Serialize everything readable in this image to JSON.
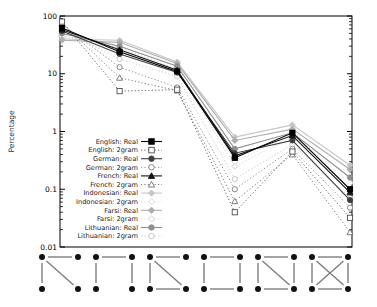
{
  "chart_data": {
    "type": "line",
    "title": "",
    "xlabel": "",
    "ylabel": "Percentage",
    "yscale": "log",
    "ylim": [
      0.01,
      100
    ],
    "ytick_labels": [
      "100",
      "10",
      "1",
      "0.1",
      "0.01"
    ],
    "grid": false,
    "legend_position": "inside-left-lower",
    "categories": [
      "motif-1",
      "motif-2",
      "motif-3",
      "motif-4",
      "motif-5",
      "motif-6"
    ],
    "series": [
      {
        "name": "english-real",
        "label": "English: Real",
        "marker": "square",
        "filled": true,
        "color": "#000000",
        "line": "solid",
        "values": [
          62,
          24,
          11,
          0.35,
          0.95,
          0.1
        ]
      },
      {
        "name": "english-2gram",
        "label": "English: 2gram",
        "marker": "square",
        "filled": false,
        "color": "#4d4d4d",
        "line": "dotted",
        "values": [
          80,
          5,
          5.3,
          0.04,
          0.45,
          0.032
        ]
      },
      {
        "name": "german-real",
        "label": "German: Real",
        "marker": "circle",
        "filled": true,
        "color": "#3f3f3f",
        "line": "solid",
        "values": [
          55,
          22,
          10.5,
          0.42,
          0.7,
          0.065
        ]
      },
      {
        "name": "german-2gram",
        "label": "German: 2gram",
        "marker": "circle",
        "filled": false,
        "color": "#7a7a7a",
        "line": "dotted",
        "values": [
          72,
          13,
          5.8,
          0.1,
          0.5,
          0.048
        ]
      },
      {
        "name": "french-real",
        "label": "French: Real",
        "marker": "triangle",
        "filled": true,
        "color": "#141414",
        "line": "solid",
        "values": [
          58,
          26,
          11.5,
          0.38,
          0.85,
          0.088
        ]
      },
      {
        "name": "french-2gram",
        "label": "French: 2gram",
        "marker": "triangle",
        "filled": false,
        "color": "#6e6e6e",
        "line": "dotted",
        "values": [
          76,
          8.5,
          5.1,
          0.062,
          0.4,
          0.018
        ]
      },
      {
        "name": "indonesian-real",
        "label": "Indonesian: Real",
        "marker": "diamond",
        "filled": true,
        "color": "#c6c6c6",
        "line": "solid",
        "values": [
          40,
          38,
          16,
          0.8,
          1.3,
          0.26
        ]
      },
      {
        "name": "indonesian-2gram",
        "label": "Indonesian: 2gram",
        "marker": "diamond",
        "filled": false,
        "color": "#d8d8d8",
        "line": "dotted",
        "values": [
          46,
          30,
          13,
          0.3,
          0.9,
          0.13
        ]
      },
      {
        "name": "farsi-real",
        "label": "Farsi: Real",
        "marker": "diamond",
        "filled": true,
        "color": "#adadad",
        "line": "solid",
        "values": [
          38,
          35,
          15,
          0.7,
          1.1,
          0.22
        ]
      },
      {
        "name": "farsi-2gram",
        "label": "Farsi: 2gram",
        "marker": "diamond",
        "filled": false,
        "color": "#cccccc",
        "line": "dotted",
        "values": [
          44,
          28,
          12,
          0.25,
          0.8,
          0.1
        ]
      },
      {
        "name": "lithuanian-real",
        "label": "Lithuanian: Real",
        "marker": "circle",
        "filled": true,
        "color": "#8f8f8f",
        "line": "solid",
        "values": [
          50,
          30,
          13.5,
          0.5,
          0.95,
          0.16
        ]
      },
      {
        "name": "lithuanian-2gram",
        "label": "Lithuanian: 2gram",
        "marker": "circle",
        "filled": false,
        "color": "#c2c2c2",
        "line": "dotted",
        "values": [
          58,
          18,
          9,
          0.15,
          0.6,
          0.07
        ]
      }
    ],
    "x_axis_motifs": {
      "description": "six 4-node subgraph diagrams used as x-axis category labels",
      "node_color": "#111111",
      "edge_color": "#7d7d7d",
      "motifs": [
        {
          "name": "motif-1",
          "edges": [
            [
              "TL",
              "TR"
            ],
            [
              "TL",
              "BL"
            ],
            [
              "TL",
              "BR"
            ]
          ]
        },
        {
          "name": "motif-2",
          "edges": [
            [
              "TL",
              "TR"
            ],
            [
              "TL",
              "BL"
            ],
            [
              "TR",
              "BR"
            ]
          ]
        },
        {
          "name": "motif-3",
          "edges": [
            [
              "TL",
              "TR"
            ],
            [
              "TL",
              "BL"
            ],
            [
              "TL",
              "BR"
            ],
            [
              "BL",
              "BR"
            ]
          ]
        },
        {
          "name": "motif-4",
          "edges": [
            [
              "TL",
              "TR"
            ],
            [
              "TL",
              "BL"
            ],
            [
              "TR",
              "BR"
            ],
            [
              "BL",
              "BR"
            ]
          ]
        },
        {
          "name": "motif-5",
          "edges": [
            [
              "TL",
              "TR"
            ],
            [
              "TL",
              "BL"
            ],
            [
              "TR",
              "BR"
            ],
            [
              "BL",
              "BR"
            ],
            [
              "TL",
              "BR"
            ]
          ]
        },
        {
          "name": "motif-6",
          "edges": [
            [
              "TL",
              "TR"
            ],
            [
              "TL",
              "BL"
            ],
            [
              "TR",
              "BR"
            ],
            [
              "BL",
              "BR"
            ],
            [
              "TL",
              "BR"
            ],
            [
              "TR",
              "BL"
            ]
          ]
        }
      ]
    },
    "layout": {
      "plot": {
        "left": 60,
        "top": 16,
        "right": 352,
        "bottom": 247
      },
      "decades": 4,
      "motif_row": {
        "centers_start": 60,
        "centers_step": 54,
        "half_width": 18,
        "top_y": 257,
        "bottom_y": 289,
        "node_radius": 3,
        "edge_gap": 6
      }
    }
  }
}
